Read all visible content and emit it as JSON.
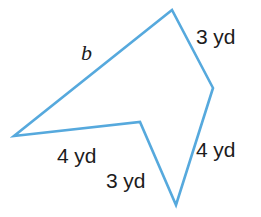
{
  "figure": {
    "name": "concave-pentagon",
    "stroke_color": "#56a9dd",
    "stroke_width": 2.6,
    "background_color": "#ffffff",
    "label_color": "#1c1c1c",
    "width": 261,
    "height": 217,
    "vertices": [
      {
        "name": "left-point",
        "x": 14,
        "y": 136
      },
      {
        "name": "notch-point",
        "x": 140,
        "y": 122
      },
      {
        "name": "bottom-point",
        "x": 176,
        "y": 205
      },
      {
        "name": "right-bend-point",
        "x": 213,
        "y": 88
      },
      {
        "name": "top-apex-point",
        "x": 172,
        "y": 10
      }
    ],
    "path": "M 14 136 L 140 122 L 176 205 L 213 88 L 172 10 Z"
  },
  "labels": {
    "side_top_right": "3 yd",
    "side_bottom_right": "4 yd",
    "side_bottom_left": "4 yd",
    "side_notch_bottom": "3 yd",
    "side_unknown": "b"
  }
}
